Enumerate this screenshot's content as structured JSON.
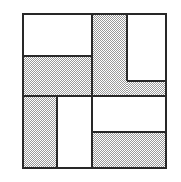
{
  "figure": {
    "type": "geometric-tiling-diagram",
    "colors": {
      "fill_shaded": "#9a9a9a",
      "fill_plain": "#ffffff",
      "stroke": "#282828",
      "background": "#ffffff"
    },
    "frame": {
      "x": 22,
      "y": 13,
      "width": 145,
      "height": 156,
      "border_width": 2
    },
    "tiles": [
      {
        "id": "tile-top-left-plain",
        "fill": "plain",
        "x": 24,
        "y": 15,
        "width": 68,
        "height": 41
      },
      {
        "id": "tile-upper-mid-shaded",
        "fill": "shaded",
        "x": 24,
        "y": 56,
        "width": 68,
        "height": 40
      },
      {
        "id": "tile-top-center-shaded",
        "fill": "shaded",
        "x": 92,
        "y": 15,
        "width": 35,
        "height": 81
      },
      {
        "id": "tile-top-right-plain",
        "fill": "plain",
        "x": 127,
        "y": 15,
        "width": 38,
        "height": 66
      },
      {
        "id": "tile-right-upper-shaded",
        "fill": "shaded",
        "x": 127,
        "y": 81,
        "width": 38,
        "height": 15
      },
      {
        "id": "tile-bottom-left-shaded",
        "fill": "shaded",
        "x": 24,
        "y": 96,
        "width": 33,
        "height": 71
      },
      {
        "id": "tile-bottom-center-plain",
        "fill": "plain",
        "x": 57,
        "y": 96,
        "width": 35,
        "height": 71
      },
      {
        "id": "tile-bottom-right-plain",
        "fill": "plain",
        "x": 92,
        "y": 96,
        "width": 73,
        "height": 36
      },
      {
        "id": "tile-bottom-right-shaded",
        "fill": "shaded",
        "x": 92,
        "y": 132,
        "width": 73,
        "height": 35
      }
    ],
    "strokes": [
      {
        "id": "stroke-h-upper-left",
        "orientation": "horizontal",
        "x": 24,
        "y": 55,
        "length": 68,
        "thickness": 2
      },
      {
        "id": "stroke-h-middle",
        "orientation": "horizontal",
        "x": 24,
        "y": 95,
        "length": 141,
        "thickness": 2
      },
      {
        "id": "stroke-h-right-upper",
        "orientation": "horizontal",
        "x": 127,
        "y": 80,
        "length": 38,
        "thickness": 2
      },
      {
        "id": "stroke-h-bottom-right",
        "orientation": "horizontal",
        "x": 92,
        "y": 131,
        "length": 73,
        "thickness": 2
      },
      {
        "id": "stroke-v-center",
        "orientation": "vertical",
        "x": 91,
        "y": 15,
        "length": 152,
        "thickness": 2
      },
      {
        "id": "stroke-v-top-right",
        "orientation": "vertical",
        "x": 126,
        "y": 15,
        "length": 66,
        "thickness": 2
      },
      {
        "id": "stroke-v-bottom-left",
        "orientation": "vertical",
        "x": 56,
        "y": 96,
        "length": 71,
        "thickness": 2
      }
    ]
  }
}
